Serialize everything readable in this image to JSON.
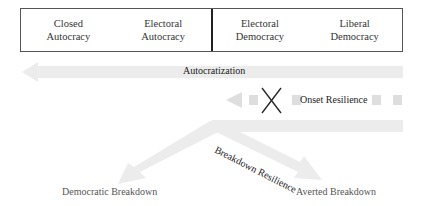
{
  "regime_spectrum": {
    "cells": [
      {
        "line1": "Closed",
        "line2": "Autocracy"
      },
      {
        "line1": "Electoral",
        "line2": "Autocracy"
      },
      {
        "line1": "Electoral",
        "line2": "Democracy"
      },
      {
        "line1": "Liberal",
        "line2": "Democracy"
      }
    ]
  },
  "arrows": {
    "autocratization": "Autocratization",
    "onset_resilience": "Onset Resilience",
    "breakdown_resilience": "Breakdown Resilience"
  },
  "outcomes": {
    "democratic_breakdown": "Democratic Breakdown",
    "averted_breakdown": "Averted Breakdown"
  },
  "colors": {
    "arrow_fill": "#ebebeb",
    "dash_fill": "#dcdcdc",
    "cross": "#222222"
  }
}
